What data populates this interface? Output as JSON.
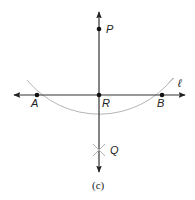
{
  "figure": {
    "caption": "(c)",
    "points": {
      "P": {
        "label": "P",
        "x": 99,
        "y": 29
      },
      "R": {
        "label": "R",
        "x": 99,
        "y": 95
      },
      "A": {
        "label": "A",
        "x": 37,
        "y": 95
      },
      "B": {
        "label": "B",
        "x": 162,
        "y": 95
      },
      "Q": {
        "label": "Q",
        "x": 99,
        "y": 150
      }
    },
    "line_label": "ℓ",
    "colors": {
      "line": "#333333",
      "arc": "#b0b0b0",
      "point": "#111111"
    }
  }
}
